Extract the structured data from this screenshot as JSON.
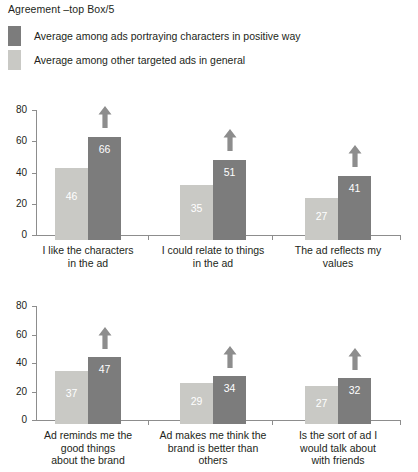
{
  "title": "Agreement –top Box/5",
  "legend": {
    "position": "top-left",
    "items": [
      {
        "label": "Average among ads portraying characters in positive way",
        "color": "#7c7c7c",
        "swatch_name": "dark-gray-swatch"
      },
      {
        "label": "Average among other targeted ads in general",
        "color": "#c9c9c5",
        "swatch_name": "light-gray-swatch"
      }
    ]
  },
  "axis": {
    "ticks": [
      "0",
      "20",
      "40",
      "60",
      "80"
    ],
    "tick_values": [
      0,
      20,
      40,
      60,
      80
    ],
    "ylim": [
      0,
      80
    ]
  },
  "chart_data": [
    {
      "type": "bar",
      "title": "Agreement –top Box/5",
      "panel": "top",
      "xlabel": "",
      "ylabel": "",
      "ylim": [
        0,
        80
      ],
      "yticks": [
        0,
        20,
        40,
        60,
        80
      ],
      "grid": false,
      "legend_position": "top-left",
      "categories": [
        "I like the characters in the ad",
        "I could relate to things in the ad",
        "The ad reflects my values"
      ],
      "series": [
        {
          "name": "Average among other targeted ads in general",
          "color": "#c9c9c5",
          "values": [
            46,
            35,
            27
          ]
        },
        {
          "name": "Average among ads portraying characters in positive way",
          "color": "#7c7c7c",
          "values": [
            66,
            51,
            41
          ]
        }
      ],
      "annotations": [
        {
          "type": "up-arrow",
          "category": "I like the characters in the ad"
        },
        {
          "type": "up-arrow",
          "category": "I could relate to things in the ad"
        },
        {
          "type": "up-arrow",
          "category": "The ad reflects my values"
        }
      ]
    },
    {
      "type": "bar",
      "panel": "bottom",
      "xlabel": "",
      "ylabel": "",
      "ylim": [
        0,
        80
      ],
      "yticks": [
        0,
        20,
        40,
        60,
        80
      ],
      "grid": false,
      "categories": [
        "Ad reminds me the good things about the brand",
        "Ad makes me think the brand is better than others",
        "Is the sort of ad I would talk about with friends"
      ],
      "series": [
        {
          "name": "Average among other targeted ads in general",
          "color": "#c9c9c5",
          "values": [
            37,
            29,
            27
          ]
        },
        {
          "name": "Average among ads portraying characters in positive way",
          "color": "#7c7c7c",
          "values": [
            47,
            34,
            32
          ]
        }
      ],
      "annotations": [
        {
          "type": "up-arrow",
          "category": "Ad reminds me the good things about the brand"
        },
        {
          "type": "up-arrow",
          "category": "Ad makes me think the brand is better than others"
        },
        {
          "type": "up-arrow",
          "category": "Is the sort of ad I would talk about with friends"
        }
      ]
    }
  ],
  "panels": {
    "top": {
      "groups": [
        {
          "label_lines": [
            "I like the characters",
            "in the ad"
          ],
          "light": {
            "value": "46"
          },
          "dark": {
            "value": "66"
          }
        },
        {
          "label_lines": [
            "I could relate to things",
            "in the ad"
          ],
          "light": {
            "value": "35"
          },
          "dark": {
            "value": "51"
          }
        },
        {
          "label_lines": [
            "The ad reflects my",
            "values"
          ],
          "light": {
            "value": "27"
          },
          "dark": {
            "value": "41"
          }
        }
      ]
    },
    "bottom": {
      "groups": [
        {
          "label_lines": [
            "Ad reminds me the",
            "good things",
            "about the brand"
          ],
          "light": {
            "value": "37"
          },
          "dark": {
            "value": "47"
          }
        },
        {
          "label_lines": [
            "Ad makes me think the",
            "brand is better than",
            "others"
          ],
          "light": {
            "value": "29"
          },
          "dark": {
            "value": "34"
          }
        },
        {
          "label_lines": [
            "Is the sort of ad I",
            "would talk about",
            "with friends"
          ],
          "light": {
            "value": "27"
          },
          "dark": {
            "value": "32"
          }
        }
      ]
    }
  }
}
